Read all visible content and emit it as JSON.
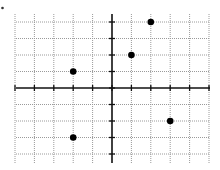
{
  "chart_data": {
    "type": "scatter",
    "title": "",
    "xlabel": "",
    "ylabel": "",
    "xlim": [
      -5,
      5
    ],
    "ylim": [
      -4,
      4
    ],
    "grid": true,
    "grid_style": "dotted",
    "axes_style": "cartesian-centered-with-ticks",
    "x_ticks": [
      -5,
      -4,
      -3,
      -2,
      -1,
      0,
      1,
      2,
      3,
      4,
      5
    ],
    "y_ticks": [
      -4,
      -3,
      -2,
      -1,
      0,
      1,
      2,
      3,
      4
    ],
    "tick_labels_shown": false,
    "series": [
      {
        "name": "points",
        "points": [
          {
            "x": 2,
            "y": 4
          },
          {
            "x": 1,
            "y": 2
          },
          {
            "x": -2,
            "y": 1
          },
          {
            "x": 3,
            "y": -2
          },
          {
            "x": -2,
            "y": -3
          }
        ]
      }
    ]
  },
  "colors": {
    "background": "#ffffff",
    "grid": "#9a9a9a",
    "axis": "#111111",
    "point": "#000000"
  },
  "layout": {
    "origin_px": [
      112,
      88
    ],
    "x_unit_px": 19.4,
    "y_unit_px": 16.5,
    "grid_left_px": 16,
    "grid_right_px": 210,
    "grid_top_px": 14,
    "grid_bottom_px": 163,
    "point_radius_px": 3.3
  }
}
